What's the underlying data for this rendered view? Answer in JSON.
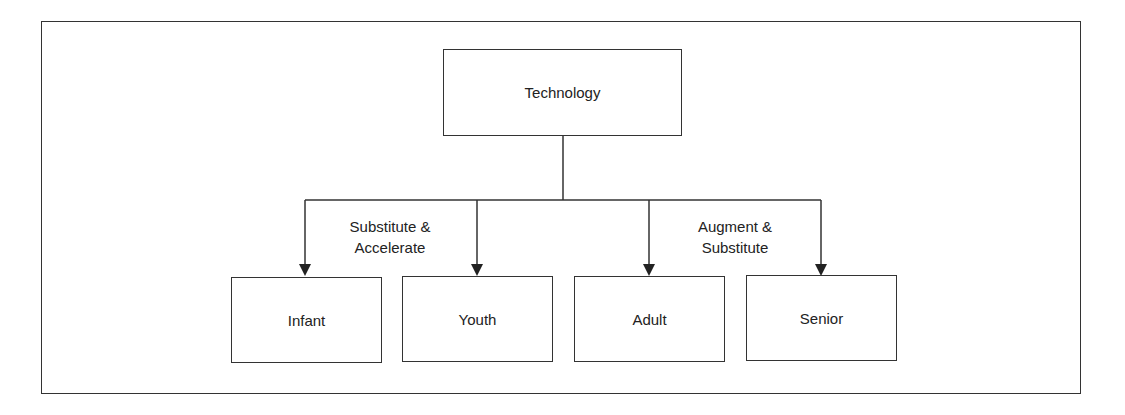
{
  "diagram": {
    "root": {
      "label": "Technology"
    },
    "groups": [
      {
        "label_line1": "Substitute &",
        "label_line2": "Accelerate"
      },
      {
        "label_line1": "Augment &",
        "label_line2": "Substitute"
      }
    ],
    "children": [
      {
        "label": "Infant"
      },
      {
        "label": "Youth"
      },
      {
        "label": "Adult"
      },
      {
        "label": "Senior"
      }
    ],
    "colors": {
      "line": "#333333",
      "text": "#222222",
      "background": "#ffffff"
    }
  }
}
